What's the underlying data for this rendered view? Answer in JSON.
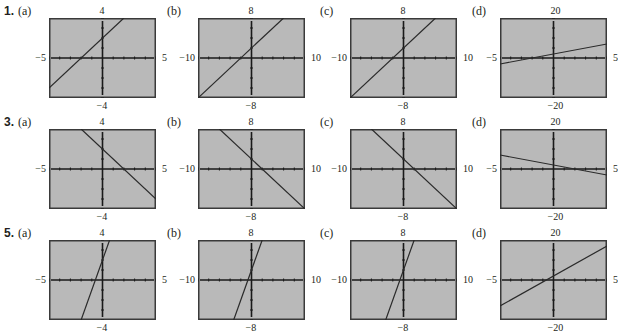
{
  "colors": {
    "screen_fill": "#b9b9b9",
    "frame_border": "#3a3a3a",
    "axis": "#1a1a1a",
    "graph_line": "#2a2a2a"
  },
  "layout": {
    "columns_x": [
      49,
      198,
      350,
      500
    ],
    "rows_y": [
      18,
      129,
      240
    ],
    "frame_w": 107,
    "frame_h": 80
  },
  "problems": [
    {
      "number": "1.",
      "equation_model": {
        "slope": 1,
        "intercept": 2
      },
      "panels": [
        {
          "label": "(a)",
          "xmin": "−5",
          "xmax": "5",
          "ymin": "−4",
          "ymax": "4"
        },
        {
          "label": "(b)",
          "xmin": "−10",
          "xmax": "10",
          "ymin": "−8",
          "ymax": "8"
        },
        {
          "label": "(c)",
          "xmin": "−10",
          "xmax": "10",
          "ymin": "−8",
          "ymax": "8"
        },
        {
          "label": "(d)",
          "xmin": "−5",
          "xmax": "5",
          "ymin": "−20",
          "ymax": "20"
        }
      ]
    },
    {
      "number": "3.",
      "equation_model": {
        "slope": -1,
        "intercept": 2
      },
      "panels": [
        {
          "label": "(a)",
          "xmin": "−5",
          "xmax": "5",
          "ymin": "−4",
          "ymax": "4"
        },
        {
          "label": "(b)",
          "xmin": "−10",
          "xmax": "10",
          "ymin": "−8",
          "ymax": "8"
        },
        {
          "label": "(c)",
          "xmin": "−10",
          "xmax": "10",
          "ymin": "−8",
          "ymax": "8"
        },
        {
          "label": "(d)",
          "xmin": "−5",
          "xmax": "5",
          "ymin": "−20",
          "ymax": "20"
        }
      ]
    },
    {
      "number": "5.",
      "equation_model": {
        "slope": 3,
        "intercept": 2
      },
      "panels": [
        {
          "label": "(a)",
          "xmin": "−5",
          "xmax": "5",
          "ymin": "−4",
          "ymax": "4"
        },
        {
          "label": "(b)",
          "xmin": "−10",
          "xmax": "10",
          "ymin": "−8",
          "ymax": "8"
        },
        {
          "label": "(c)",
          "xmin": "−10",
          "xmax": "10",
          "ymin": "−8",
          "ymax": "8"
        },
        {
          "label": "(d)",
          "xmin": "−5",
          "xmax": "5",
          "ymin": "−20",
          "ymax": "20"
        }
      ]
    }
  ],
  "chart_data": [
    {
      "type": "line",
      "title": "1(a)",
      "xlim": [
        -5,
        5
      ],
      "ylim": [
        -4,
        4
      ],
      "series": [
        {
          "name": "y = x + 2",
          "slope": 1,
          "intercept": 2
        }
      ]
    },
    {
      "type": "line",
      "title": "1(b)",
      "xlim": [
        -10,
        10
      ],
      "ylim": [
        -8,
        8
      ],
      "series": [
        {
          "name": "y = x + 2",
          "slope": 1,
          "intercept": 2
        }
      ]
    },
    {
      "type": "line",
      "title": "1(c)",
      "xlim": [
        -10,
        10
      ],
      "ylim": [
        -8,
        8
      ],
      "series": [
        {
          "name": "y = x + 2",
          "slope": 1,
          "intercept": 2
        }
      ]
    },
    {
      "type": "line",
      "title": "1(d)",
      "xlim": [
        -5,
        5
      ],
      "ylim": [
        -20,
        20
      ],
      "series": [
        {
          "name": "y = x + 2",
          "slope": 1,
          "intercept": 2
        }
      ]
    },
    {
      "type": "line",
      "title": "3(a)",
      "xlim": [
        -5,
        5
      ],
      "ylim": [
        -4,
        4
      ],
      "series": [
        {
          "name": "y = -x + 2",
          "slope": -1,
          "intercept": 2
        }
      ]
    },
    {
      "type": "line",
      "title": "3(b)",
      "xlim": [
        -10,
        10
      ],
      "ylim": [
        -8,
        8
      ],
      "series": [
        {
          "name": "y = -x + 2",
          "slope": -1,
          "intercept": 2
        }
      ]
    },
    {
      "type": "line",
      "title": "3(c)",
      "xlim": [
        -10,
        10
      ],
      "ylim": [
        -8,
        8
      ],
      "series": [
        {
          "name": "y = -x + 2",
          "slope": -1,
          "intercept": 2
        }
      ]
    },
    {
      "type": "line",
      "title": "3(d)",
      "xlim": [
        -5,
        5
      ],
      "ylim": [
        -20,
        20
      ],
      "series": [
        {
          "name": "y = -x + 2",
          "slope": -1,
          "intercept": 2
        }
      ]
    },
    {
      "type": "line",
      "title": "5(a)",
      "xlim": [
        -5,
        5
      ],
      "ylim": [
        -4,
        4
      ],
      "series": [
        {
          "name": "y = 3x + 2",
          "slope": 3,
          "intercept": 2
        }
      ]
    },
    {
      "type": "line",
      "title": "5(b)",
      "xlim": [
        -10,
        10
      ],
      "ylim": [
        -8,
        8
      ],
      "series": [
        {
          "name": "y = 3x + 2",
          "slope": 3,
          "intercept": 2
        }
      ]
    },
    {
      "type": "line",
      "title": "5(c)",
      "xlim": [
        -10,
        10
      ],
      "ylim": [
        -8,
        8
      ],
      "series": [
        {
          "name": "y = 3x + 2",
          "slope": 3,
          "intercept": 2
        }
      ]
    },
    {
      "type": "line",
      "title": "5(d)",
      "xlim": [
        -5,
        5
      ],
      "ylim": [
        -20,
        20
      ],
      "series": [
        {
          "name": "y = 3x + 2",
          "slope": 3,
          "intercept": 2
        }
      ]
    }
  ]
}
